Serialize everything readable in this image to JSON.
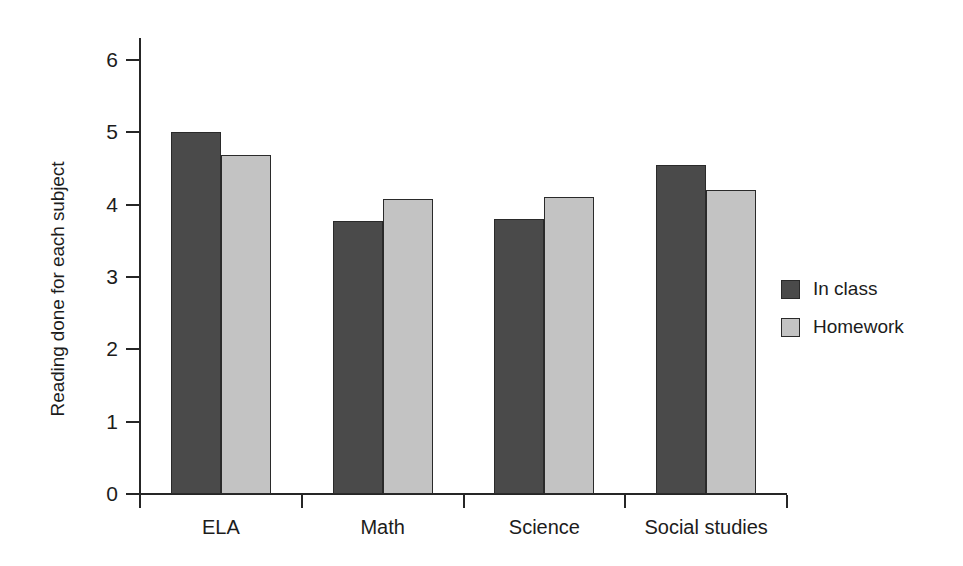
{
  "chart_data": {
    "type": "bar",
    "title": "",
    "subtitle": "",
    "xlabel": "",
    "ylabel": "Reading done for each subject",
    "categories": [
      "ELA",
      "Math",
      "Science",
      "Social studies"
    ],
    "series": [
      {
        "name": "In class",
        "color": "#4a4a4a",
        "values": [
          5.0,
          3.77,
          3.8,
          4.55
        ]
      },
      {
        "name": "Homework",
        "color": "#c3c3c3",
        "values": [
          4.68,
          4.08,
          4.11,
          4.2
        ]
      }
    ],
    "ylim": [
      0,
      6
    ],
    "ytick_values": [
      0,
      1,
      2,
      3,
      4,
      5,
      6
    ],
    "ytick_labels": [
      "0",
      "1",
      "2",
      "3",
      "4",
      "5",
      "6"
    ],
    "grid": false,
    "legend_position": "right",
    "background_color": "#ffffff",
    "axis_color": "#262626"
  },
  "legend": {
    "entries": [
      {
        "label": "In class"
      },
      {
        "label": "Homework"
      }
    ]
  }
}
